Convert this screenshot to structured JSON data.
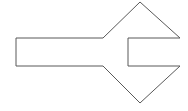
{
  "canvas": {
    "width": 188,
    "height": 111,
    "background_color": "#ffffff",
    "description": "Line drawing of a single closed polygon outline"
  },
  "shape": {
    "name": "left-pointing-notched-arrow",
    "label": "Left-pointing arrow with rectangular tail and notched right side",
    "fill_color": "#ffffff",
    "stroke_color": "#595959",
    "stroke_width": 1,
    "closed": true,
    "points": "16,38 103,38 140,2 180,38 128,38 128,66 180,66 140,103 103,66 16,66",
    "vertices": [
      {
        "x": 16,
        "y": 38,
        "role": "tail-top-left"
      },
      {
        "x": 103,
        "y": 38,
        "role": "tail-top-right-junction"
      },
      {
        "x": 140,
        "y": 2,
        "role": "top-apex"
      },
      {
        "x": 180,
        "y": 38,
        "role": "upper-right-vertex"
      },
      {
        "x": 128,
        "y": 38,
        "role": "notch-top-inner"
      },
      {
        "x": 128,
        "y": 66,
        "role": "notch-bottom-inner"
      },
      {
        "x": 180,
        "y": 66,
        "role": "lower-right-vertex"
      },
      {
        "x": 140,
        "y": 103,
        "role": "bottom-apex"
      },
      {
        "x": 103,
        "y": 66,
        "role": "tail-bottom-right-junction"
      },
      {
        "x": 16,
        "y": 66,
        "role": "tail-bottom-left"
      }
    ]
  }
}
